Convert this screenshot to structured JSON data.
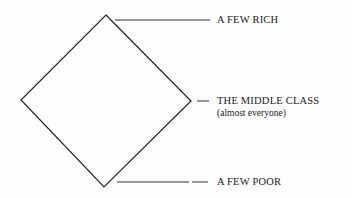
{
  "diagram": {
    "shape": "diamond",
    "labels": {
      "top": "A FEW RICH",
      "middle": "THE MIDDLE CLASS",
      "middle_sub": "(almost everyone)",
      "bottom": "A FEW POOR"
    },
    "colors": {
      "line": "#222222",
      "text": "#1a1a1a",
      "background": "#fdfdfd"
    }
  }
}
